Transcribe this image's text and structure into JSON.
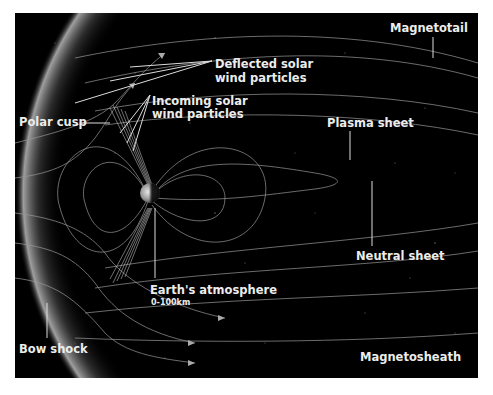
{
  "diagram": {
    "background_color": "#000000",
    "label_color": "#ececec",
    "labels": {
      "magnetotail": "Magnetotail",
      "deflected_line1": "Deflected solar",
      "deflected_line2": "wind particles",
      "incoming_line1": "Incoming solar",
      "incoming_line2": "wind particles",
      "polar_cusp": "Polar cusp",
      "plasma_sheet": "Plasma sheet",
      "neutral_sheet": "Neutral sheet",
      "earths_atmosphere": "Earth's atmosphere",
      "atmosphere_range": "0-100km",
      "bow_shock": "Bow shock",
      "magnetosheath": "Magnetosheath"
    }
  }
}
